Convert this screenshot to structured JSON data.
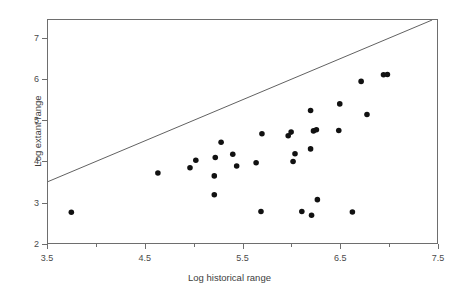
{
  "chart_data": {
    "type": "scatter",
    "title": "",
    "xlabel": "Log historical range",
    "ylabel": "Log extant range",
    "xlim": [
      3.5,
      7.5
    ],
    "ylim": [
      2.0,
      7.45
    ],
    "grid": false,
    "legend": null,
    "xticks": [
      3.5,
      4.5,
      5.5,
      6.5,
      7.5
    ],
    "xticklabels": [
      "3.5",
      "4.5",
      "5.5",
      "6.5",
      "7.5"
    ],
    "xminorticks": [
      4.0,
      5.0,
      6.0,
      7.0
    ],
    "yticks": [
      2,
      3,
      4,
      5,
      6,
      7
    ],
    "yticklabels": [
      "2",
      "3",
      "4",
      "5",
      "6",
      "7"
    ],
    "marker": "filled-circle",
    "marker_color": "#111111",
    "marker_size_px": 5.6,
    "points": [
      {
        "x": 3.74,
        "y": 2.75
      },
      {
        "x": 4.63,
        "y": 3.71
      },
      {
        "x": 4.96,
        "y": 3.84
      },
      {
        "x": 5.02,
        "y": 4.02
      },
      {
        "x": 5.22,
        "y": 4.09
      },
      {
        "x": 5.21,
        "y": 3.64
      },
      {
        "x": 5.21,
        "y": 3.18
      },
      {
        "x": 5.28,
        "y": 4.46
      },
      {
        "x": 5.4,
        "y": 4.17
      },
      {
        "x": 5.44,
        "y": 3.88
      },
      {
        "x": 5.64,
        "y": 3.96
      },
      {
        "x": 5.7,
        "y": 4.67
      },
      {
        "x": 5.69,
        "y": 2.77
      },
      {
        "x": 5.97,
        "y": 4.62
      },
      {
        "x": 6.0,
        "y": 4.71
      },
      {
        "x": 6.02,
        "y": 3.99
      },
      {
        "x": 6.04,
        "y": 4.18
      },
      {
        "x": 6.11,
        "y": 2.77
      },
      {
        "x": 6.2,
        "y": 4.3
      },
      {
        "x": 6.21,
        "y": 2.68
      },
      {
        "x": 6.23,
        "y": 4.74
      },
      {
        "x": 6.26,
        "y": 4.77
      },
      {
        "x": 6.2,
        "y": 5.24
      },
      {
        "x": 6.27,
        "y": 3.06
      },
      {
        "x": 6.49,
        "y": 4.75
      },
      {
        "x": 6.5,
        "y": 5.4
      },
      {
        "x": 6.63,
        "y": 2.76
      },
      {
        "x": 6.78,
        "y": 5.14
      },
      {
        "x": 6.72,
        "y": 5.95
      },
      {
        "x": 6.95,
        "y": 6.11
      },
      {
        "x": 6.99,
        "y": 6.12
      }
    ],
    "reference_line": {
      "label": "1:1 line",
      "x": [
        3.5,
        7.45
      ],
      "y": [
        3.5,
        7.45
      ],
      "color": "#4d4d4d",
      "width_px": 0.9
    }
  }
}
